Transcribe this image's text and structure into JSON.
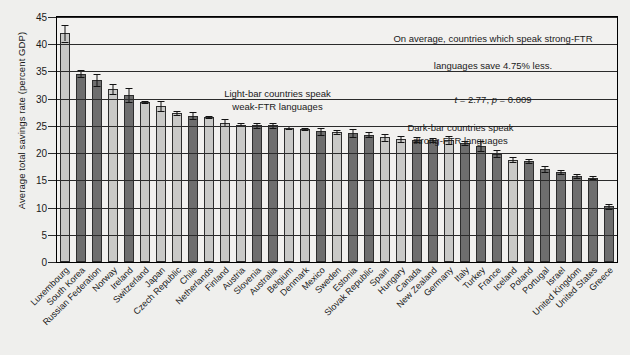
{
  "axis": {
    "ylabel": "Average total savings rate (percent GDP)",
    "yticks": [
      "0",
      "5",
      "10",
      "15",
      "20",
      "25",
      "30",
      "35",
      "40",
      "45"
    ]
  },
  "annotations": {
    "light_note": "Light-bar countries speak\nweak-FTR languages",
    "dark_note": "Dark-bar countries speak\nstrong-FTR languages",
    "stat_line1": "On average, countries which speak strong-FTR",
    "stat_line2": "languages save 4.75% less.",
    "stat_t_label": "t",
    "stat_t_value": " = 2.77, ",
    "stat_p_label": "p",
    "stat_p_value": " = 0.009"
  },
  "colors": {
    "light_bar": "#c9c9c7",
    "dark_bar": "#6e6e6e",
    "background": "#efefed",
    "plot_background": "#f2f1ef",
    "axis": "#2b2b2b"
  },
  "chart_data": {
    "type": "bar",
    "title": "",
    "xlabel": "",
    "ylabel": "Average total savings rate (percent GDP)",
    "ylim": [
      0,
      45
    ],
    "ytick_step": 5,
    "grid": true,
    "legend": "none",
    "error_bars": true,
    "categories": [
      "Luxembourg",
      "South Korea",
      "Russian Federation",
      "Norway",
      "Ireland",
      "Switzerland",
      "Japan",
      "Czech Republic",
      "Chile",
      "Netherlands",
      "Finland",
      "Austria",
      "Slovenia",
      "Australia",
      "Belgium",
      "Denmark",
      "Mexico",
      "Sweden",
      "Estonia",
      "Slovak Republic",
      "Spain",
      "Hungary",
      "Canada",
      "New Zealand",
      "Germany",
      "Italy",
      "Turkey",
      "France",
      "Iceland",
      "Poland",
      "Portugal",
      "Israel",
      "United Kingdom",
      "United States",
      "Greece"
    ],
    "values": [
      42.0,
      34.6,
      33.4,
      31.8,
      30.6,
      29.4,
      28.6,
      27.4,
      26.9,
      26.7,
      25.6,
      25.2,
      25.1,
      25.1,
      24.7,
      24.4,
      24.0,
      23.9,
      23.7,
      23.4,
      22.9,
      22.6,
      22.5,
      22.4,
      22.4,
      21.8,
      21.3,
      19.9,
      18.8,
      18.6,
      17.1,
      16.5,
      15.8,
      15.5,
      10.2
    ],
    "errors": [
      1.5,
      0.6,
      1.1,
      0.9,
      1.3,
      0.2,
      0.9,
      0.4,
      0.7,
      0.2,
      0.7,
      0.3,
      0.4,
      0.5,
      0.2,
      0.2,
      0.6,
      0.3,
      0.7,
      0.4,
      0.6,
      0.5,
      0.5,
      0.4,
      0.8,
      0.4,
      0.9,
      0.6,
      0.4,
      0.4,
      0.5,
      0.4,
      0.3,
      0.3,
      0.4
    ],
    "ftr_type": [
      "weak",
      "strong",
      "strong",
      "weak",
      "strong",
      "weak",
      "weak",
      "weak",
      "strong",
      "weak",
      "weak",
      "weak",
      "strong",
      "strong",
      "weak",
      "weak",
      "strong",
      "weak",
      "strong",
      "strong",
      "weak",
      "weak",
      "strong",
      "strong",
      "weak",
      "strong",
      "strong",
      "strong",
      "weak",
      "strong",
      "strong",
      "strong",
      "strong",
      "strong",
      "strong"
    ],
    "series": [
      {
        "name": "Average total savings rate",
        "values": [
          42.0,
          34.6,
          33.4,
          31.8,
          30.6,
          29.4,
          28.6,
          27.4,
          26.9,
          26.7,
          25.6,
          25.2,
          25.1,
          25.1,
          24.7,
          24.4,
          24.0,
          23.9,
          23.7,
          23.4,
          22.9,
          22.6,
          22.5,
          22.4,
          22.4,
          21.8,
          21.3,
          19.9,
          18.8,
          18.6,
          17.1,
          16.5,
          15.8,
          15.5,
          10.2
        ]
      }
    ]
  }
}
